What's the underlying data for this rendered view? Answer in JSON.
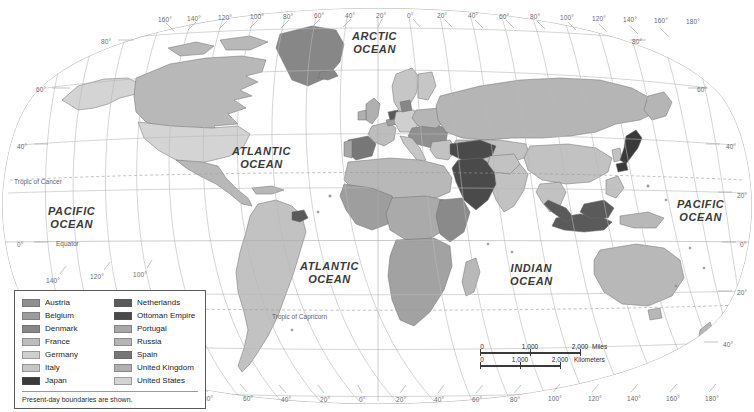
{
  "map": {
    "title": "World Map — Present-day boundaries",
    "projection": "oval/Robinson-like world projection",
    "ocean_labels": [
      {
        "name": "arctic-ocean",
        "lines": [
          "ARCTIC",
          "OCEAN"
        ],
        "x": 352,
        "y": 30
      },
      {
        "name": "atlantic-north",
        "lines": [
          "ATLANTIC",
          "OCEAN"
        ],
        "x": 232,
        "y": 145
      },
      {
        "name": "pacific-west",
        "lines": [
          "PACIFIC",
          "OCEAN"
        ],
        "x": 48,
        "y": 205
      },
      {
        "name": "pacific-east",
        "lines": [
          "PACIFIC",
          "OCEAN"
        ],
        "x": 677,
        "y": 198
      },
      {
        "name": "atlantic-south",
        "lines": [
          "ATLANTIC",
          "OCEAN"
        ],
        "x": 300,
        "y": 260
      },
      {
        "name": "indian-ocean",
        "lines": [
          "INDIAN",
          "OCEAN"
        ],
        "x": 510,
        "y": 262
      }
    ],
    "reference_lines": [
      {
        "name": "tropic-of-cancer",
        "label": "Tropic of Cancer",
        "x": 14,
        "y": 178
      },
      {
        "name": "equator",
        "label": "Equator",
        "x": 56,
        "y": 240
      },
      {
        "name": "tropic-of-capricorn",
        "label": "Tropic of Capricorn",
        "x": 272,
        "y": 313
      }
    ],
    "longitude_top": [
      {
        "label": "160°",
        "x": 158,
        "y": 16
      },
      {
        "label": "140°",
        "x": 187,
        "y": 15
      },
      {
        "label": "120°",
        "x": 218,
        "y": 14
      },
      {
        "label": "100°",
        "x": 250,
        "y": 13
      },
      {
        "label": "80°",
        "x": 283,
        "y": 13
      },
      {
        "label": "60°",
        "x": 314,
        "y": 12
      },
      {
        "label": "40°",
        "x": 345,
        "y": 12
      },
      {
        "label": "20°",
        "x": 376,
        "y": 12
      },
      {
        "label": "0°",
        "x": 407,
        "y": 12
      },
      {
        "label": "20°",
        "x": 437,
        "y": 12
      },
      {
        "label": "40°",
        "x": 468,
        "y": 12
      },
      {
        "label": "60°",
        "x": 499,
        "y": 13
      },
      {
        "label": "80°",
        "x": 530,
        "y": 13
      },
      {
        "label": "100°",
        "x": 560,
        "y": 14
      },
      {
        "label": "120°",
        "x": 592,
        "y": 15
      },
      {
        "label": "140°",
        "x": 623,
        "y": 16
      },
      {
        "label": "160°",
        "x": 654,
        "y": 17
      },
      {
        "label": "180°",
        "x": 686,
        "y": 18
      }
    ],
    "longitude_bottom": [
      {
        "label": "140°",
        "x": 46,
        "y": 277
      },
      {
        "label": "120°",
        "x": 90,
        "y": 273
      },
      {
        "label": "100°",
        "x": 133,
        "y": 271
      },
      {
        "label": "80°",
        "x": 203,
        "y": 395
      },
      {
        "label": "60°",
        "x": 243,
        "y": 395
      },
      {
        "label": "40°",
        "x": 281,
        "y": 396
      },
      {
        "label": "20°",
        "x": 320,
        "y": 396
      },
      {
        "label": "0°",
        "x": 359,
        "y": 396
      },
      {
        "label": "20°",
        "x": 396,
        "y": 396
      },
      {
        "label": "40°",
        "x": 434,
        "y": 396
      },
      {
        "label": "60°",
        "x": 472,
        "y": 396
      },
      {
        "label": "80°",
        "x": 510,
        "y": 396
      },
      {
        "label": "100°",
        "x": 548,
        "y": 395
      },
      {
        "label": "120°",
        "x": 588,
        "y": 395
      },
      {
        "label": "140°",
        "x": 627,
        "y": 395
      },
      {
        "label": "160°",
        "x": 666,
        "y": 395
      },
      {
        "label": "180°",
        "x": 705,
        "y": 395
      }
    ],
    "latitude_left": [
      {
        "label": "80°",
        "x": 101,
        "y": 38
      },
      {
        "label": "60°",
        "x": 36,
        "y": 86
      },
      {
        "label": "40°",
        "x": 17,
        "y": 143
      },
      {
        "label": "0°",
        "x": 17,
        "y": 241
      },
      {
        "label": "40°",
        "x": 135,
        "y": 355
      }
    ],
    "latitude_right": [
      {
        "label": "80°",
        "x": 632,
        "y": 38
      },
      {
        "label": "60°",
        "x": 697,
        "y": 86
      },
      {
        "label": "40°",
        "x": 726,
        "y": 143
      },
      {
        "label": "20°",
        "x": 737,
        "y": 192
      },
      {
        "label": "0°",
        "x": 740,
        "y": 241
      },
      {
        "label": "20°",
        "x": 737,
        "y": 289
      },
      {
        "label": "40°",
        "x": 723,
        "y": 341
      }
    ]
  },
  "legend": {
    "note": "Present-day boundaries are shown.",
    "columns": [
      {
        "items": [
          {
            "label": "Austria",
            "color": "#8f8f8f"
          },
          {
            "label": "Belgium",
            "color": "#9d9d9d"
          },
          {
            "label": "Denmark",
            "color": "#878787"
          },
          {
            "label": "France",
            "color": "#bdbdbd"
          },
          {
            "label": "Germany",
            "color": "#cfcfcf"
          },
          {
            "label": "Italy",
            "color": "#c6c6c6"
          },
          {
            "label": "Japan",
            "color": "#3a3a3a"
          }
        ]
      },
      {
        "items": [
          {
            "label": "Netherlands",
            "color": "#5a5a5a"
          },
          {
            "label": "Ottoman Empire",
            "color": "#4a4a4a"
          },
          {
            "label": "Portugal",
            "color": "#a8a8a8"
          },
          {
            "label": "Russia",
            "color": "#b5b5b5"
          },
          {
            "label": "Spain",
            "color": "#777777"
          },
          {
            "label": "United Kingdom",
            "color": "#b0b0b0"
          },
          {
            "label": "United States",
            "color": "#d4d4d4"
          }
        ]
      }
    ]
  },
  "scalebar": {
    "miles": {
      "unit": "Miles",
      "ticks": [
        "0",
        "1,000",
        "2,000"
      ]
    },
    "kilometers": {
      "unit": "Kilometers",
      "ticks": [
        "0",
        "1,000",
        "2,000"
      ]
    }
  }
}
